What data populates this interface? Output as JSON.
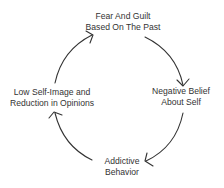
{
  "diagram": {
    "type": "cycle",
    "direction": "clockwise",
    "nodes": [
      {
        "id": "top",
        "line1": "Fear And Guilt",
        "line2": "Based On The Past"
      },
      {
        "id": "right",
        "line1": "Negative Belief",
        "line2": "About Self"
      },
      {
        "id": "bottom",
        "line1": "Addictive",
        "line2": "Behavior"
      },
      {
        "id": "left",
        "line1": "Low Self-Image and",
        "line2": "Reduction in Opinions"
      }
    ],
    "edges": [
      {
        "from": "top",
        "to": "right"
      },
      {
        "from": "right",
        "to": "bottom"
      },
      {
        "from": "bottom",
        "to": "left"
      },
      {
        "from": "left",
        "to": "top"
      }
    ],
    "colors": {
      "stroke": "#333333",
      "text": "#333333",
      "background": "#ffffff"
    }
  }
}
